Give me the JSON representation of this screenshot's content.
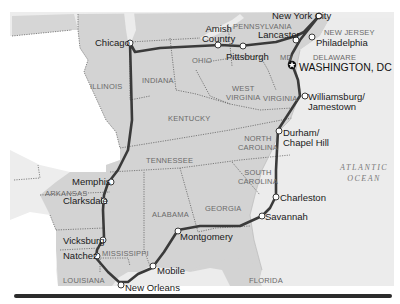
{
  "map": {
    "colors": {
      "land_route_states": "#d4d4d4",
      "land_other": "#e4e4e4",
      "water": "#f0f0f0",
      "unshaded": "#ffffff",
      "route": "#3a3a3a",
      "border": "#555555",
      "base_bar": "#2b2b2b"
    },
    "states": {
      "illinois": "ILLINOIS",
      "indiana": "INDIANA",
      "ohio": "OHIO",
      "pennsylvania": "PENNSYLVANIA",
      "new_jersey": "NEW JERSEY",
      "delaware": "DELAWARE",
      "maryland": "MD",
      "west_virginia_1": "WEST",
      "west_virginia_2": "VIRGINIA",
      "virginia": "VIRGINIA",
      "kentucky": "KENTUCKY",
      "tennessee": "TENNESSEE",
      "north_carolina_1": "NORTH",
      "north_carolina_2": "CAROLINA",
      "south_carolina_1": "SOUTH",
      "south_carolina_2": "CAROLINA",
      "georgia": "GEORGIA",
      "alabama": "ALABAMA",
      "mississippi": "MISSISSIPPI",
      "arkansas": "ARKANSAS",
      "louisiana": "LOUISIANA",
      "florida": "FLORIDA"
    },
    "ocean": {
      "line1": "ATLANTIC",
      "line2": "OCEAN"
    },
    "capital": {
      "label": "WASHINGTON, DC",
      "icon": "star-icon"
    },
    "stops": [
      {
        "name": "New York City"
      },
      {
        "name": "Philadelphia"
      },
      {
        "name": "Lancaster"
      },
      {
        "name_line1": "Amish",
        "name_line2": "Country"
      },
      {
        "name": "Pittsburgh"
      },
      {
        "name": "Chicago"
      },
      {
        "name": "Memphis"
      },
      {
        "name": "Clarksdale"
      },
      {
        "name": "Vicksburg"
      },
      {
        "name": "Natchez"
      },
      {
        "name": "New Orleans"
      },
      {
        "name": "Mobile"
      },
      {
        "name": "Montgomery"
      },
      {
        "name": "Savannah"
      },
      {
        "name": "Charleston"
      },
      {
        "name_line1": "Durham/",
        "name_line2": "Chapel Hill"
      },
      {
        "name_line1": "Williamsburg/",
        "name_line2": "Jamestown"
      }
    ]
  }
}
